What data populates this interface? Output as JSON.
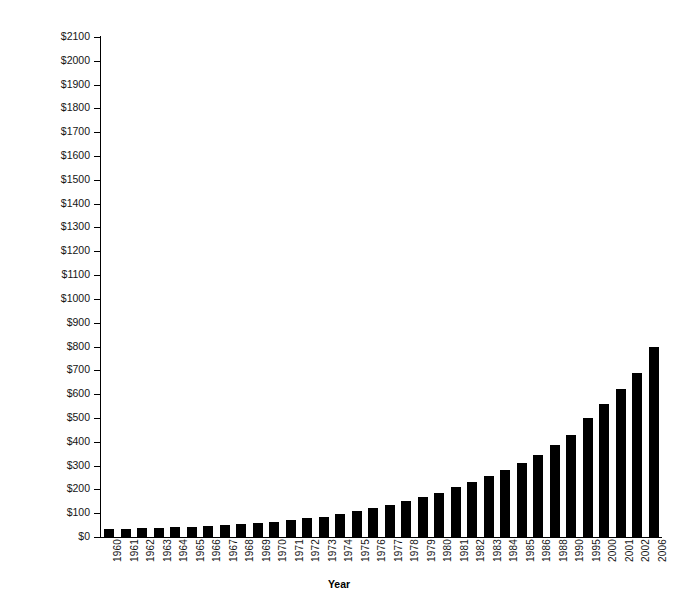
{
  "chart_data": {
    "type": "bar",
    "title": "",
    "subtitle": "",
    "xlabel": "Year",
    "ylabel": "",
    "ylim": [
      0,
      2100
    ],
    "ytick_step": 100,
    "grid": false,
    "legend": null,
    "bar_color": "#000000",
    "background": "#ffffff",
    "y_tick_labels": [
      "$2100",
      "$2000",
      "$1900",
      "$1800",
      "$1700",
      "$1600",
      "$1500",
      "$1400",
      "$1300",
      "$1200",
      "$1100",
      "$1000",
      "$900",
      "$800",
      "$700",
      "$600",
      "$500",
      "$400",
      "$300",
      "$200",
      "$100",
      "$0"
    ],
    "y_tick_values": [
      2100,
      2000,
      1900,
      1800,
      1700,
      1600,
      1500,
      1400,
      1300,
      1200,
      1100,
      1000,
      900,
      800,
      700,
      600,
      500,
      400,
      300,
      200,
      100,
      0
    ],
    "categories": [
      "1960",
      "1961",
      "1962",
      "1963",
      "1964",
      "1965",
      "1966",
      "1967",
      "1968",
      "1969",
      "1970",
      "1971",
      "1972",
      "1973",
      "1974",
      "1975",
      "1976",
      "1977",
      "1978",
      "1979",
      "1980",
      "1981",
      "1982",
      "1983",
      "1984",
      "1985",
      "1986",
      "1988",
      "1990",
      "1995",
      "2000",
      "2001",
      "2002",
      "2006"
    ],
    "values": [
      33,
      35,
      37,
      39,
      41,
      44,
      47,
      50,
      54,
      58,
      64,
      72,
      78,
      86,
      95,
      108,
      122,
      136,
      150,
      168,
      186,
      208,
      232,
      256,
      280,
      310,
      345,
      385,
      430,
      500,
      560,
      620,
      690,
      800
    ]
  },
  "axis": {
    "x_title": "Year"
  }
}
